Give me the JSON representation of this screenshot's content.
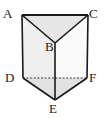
{
  "figure": {
    "name": "triangular-prism",
    "background_color": "#ffffff",
    "stroke_color": "#1a1a1a",
    "hidden_edge_style": "dashed",
    "faces": {
      "top_left_color": "#ededed",
      "top_right_color": "#e3e3e3",
      "front_left_color": "#efefef",
      "front_right_color": "#fafafa",
      "bottom_left_color": "#e8e8e8",
      "bottom_right_color": "#dedede"
    },
    "vertices": [
      {
        "id": "A",
        "label": "A",
        "x": 22,
        "y": 15
      },
      {
        "id": "C",
        "label": "C",
        "x": 88,
        "y": 15
      },
      {
        "id": "B",
        "label": "B",
        "x": 55,
        "y": 43
      },
      {
        "id": "D",
        "label": "D",
        "x": 23,
        "y": 78
      },
      {
        "id": "F",
        "label": "F",
        "x": 87,
        "y": 78
      },
      {
        "id": "E",
        "label": "E",
        "x": 55,
        "y": 100
      }
    ],
    "labels": {
      "A": "A",
      "B": "B",
      "C": "C",
      "D": "D",
      "E": "E",
      "F": "F"
    },
    "edges": [
      {
        "from": "A",
        "to": "C",
        "hidden": false
      },
      {
        "from": "A",
        "to": "B",
        "hidden": false
      },
      {
        "from": "B",
        "to": "C",
        "hidden": false
      },
      {
        "from": "A",
        "to": "D",
        "hidden": false
      },
      {
        "from": "C",
        "to": "F",
        "hidden": false
      },
      {
        "from": "B",
        "to": "E",
        "hidden": false
      },
      {
        "from": "D",
        "to": "E",
        "hidden": false
      },
      {
        "from": "E",
        "to": "F",
        "hidden": false
      },
      {
        "from": "D",
        "to": "F",
        "hidden": true
      }
    ]
  }
}
